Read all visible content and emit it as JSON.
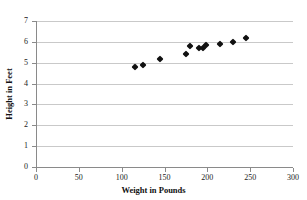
{
  "chart_data": {
    "type": "scatter",
    "title": "",
    "xlabel": "Weight in Pounds",
    "ylabel": "Height in Feet",
    "xlim": [
      0,
      300
    ],
    "ylim": [
      0,
      7
    ],
    "xticks": [
      0,
      50,
      100,
      150,
      200,
      250,
      300
    ],
    "yticks": [
      0,
      1,
      2,
      3,
      4,
      5,
      6,
      7
    ],
    "xtick_labels": [
      "0",
      "50",
      "100",
      "150",
      "200",
      "250",
      "300"
    ],
    "ytick_labels": [
      "0",
      "1",
      "2",
      "3",
      "4",
      "5",
      "6",
      "7"
    ],
    "grid": "horizontal",
    "legend": null,
    "marker": "diamond",
    "marker_color": "#111111",
    "points": [
      {
        "x": 115,
        "y": 4.8
      },
      {
        "x": 125,
        "y": 4.9
      },
      {
        "x": 145,
        "y": 5.2
      },
      {
        "x": 175,
        "y": 5.4
      },
      {
        "x": 180,
        "y": 5.8
      },
      {
        "x": 190,
        "y": 5.7
      },
      {
        "x": 195,
        "y": 5.7
      },
      {
        "x": 198,
        "y": 5.85
      },
      {
        "x": 215,
        "y": 5.9
      },
      {
        "x": 230,
        "y": 6.0
      },
      {
        "x": 245,
        "y": 6.2
      }
    ]
  },
  "colors": {
    "marker": "#111111",
    "gridline": "#c9c9c9",
    "axis": "#8a8a8a",
    "text": "#1a1a1a",
    "background": "#ffffff"
  }
}
